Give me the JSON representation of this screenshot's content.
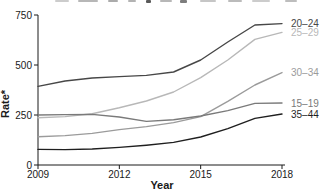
{
  "figure": {
    "top_title_clipped": true,
    "background_color": "#ffffff"
  },
  "chart_data": {
    "type": "line",
    "title": "",
    "xlabel": "Year",
    "ylabel": "Rate*",
    "x": [
      2009,
      2010,
      2011,
      2012,
      2013,
      2014,
      2015,
      2016,
      2017,
      2018
    ],
    "xticks": [
      2009,
      2012,
      2015,
      2018
    ],
    "yticks": [
      0,
      250,
      500,
      750
    ],
    "ylim": [
      0,
      750
    ],
    "grid": false,
    "legend_position": "right-end-labels",
    "series": [
      {
        "name": "20–24",
        "color": "#474747",
        "values": [
          393,
          420,
          435,
          442,
          448,
          465,
          525,
          615,
          700,
          707
        ]
      },
      {
        "name": "25–29",
        "color": "#b8b8b8",
        "values": [
          236,
          242,
          256,
          286,
          320,
          365,
          437,
          525,
          628,
          663
        ]
      },
      {
        "name": "30–34",
        "color": "#9b9b9b",
        "values": [
          141,
          147,
          158,
          177,
          192,
          212,
          242,
          318,
          400,
          462
        ]
      },
      {
        "name": "15–19",
        "color": "#7a7a7a",
        "values": [
          250,
          252,
          253,
          240,
          218,
          226,
          245,
          272,
          308,
          310
        ]
      },
      {
        "name": "35–44",
        "color": "#1f1f1f",
        "values": [
          78,
          77,
          80,
          88,
          99,
          113,
          140,
          182,
          233,
          255
        ]
      }
    ]
  }
}
